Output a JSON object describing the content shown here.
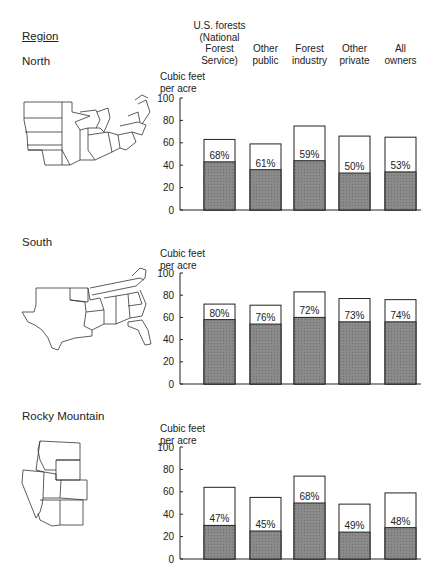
{
  "header": {
    "region_label": "Region",
    "columns": [
      "U.S. forests\n(National\nForest\nService)",
      "Other\npublic",
      "Forest\nindustry",
      "Other\nprivate",
      "All\nowners"
    ]
  },
  "colors": {
    "shaded": "#8a8a8a",
    "outline": "#222222",
    "background": "#ffffff"
  },
  "chart_data": [
    {
      "type": "bar",
      "title": "North",
      "ylabel": "Cubic feet per acre",
      "ylim": [
        0,
        100
      ],
      "yticks": [
        0,
        20,
        40,
        60,
        80,
        100
      ],
      "categories": [
        "U.S. forests (National Forest Service)",
        "Other public",
        "Forest industry",
        "Other private",
        "All owners"
      ],
      "series": [
        {
          "name": "total",
          "values": [
            63,
            59,
            75,
            66,
            65
          ]
        },
        {
          "name": "shaded_portion",
          "values": [
            43,
            36,
            44,
            33,
            34
          ]
        }
      ],
      "labels": [
        "68%",
        "61%",
        "59%",
        "50%",
        "53%"
      ]
    },
    {
      "type": "bar",
      "title": "South",
      "ylabel": "Cubic feet per acre",
      "ylim": [
        0,
        100
      ],
      "yticks": [
        0,
        20,
        40,
        60,
        80,
        100
      ],
      "categories": [
        "U.S. forests (National Forest Service)",
        "Other public",
        "Forest industry",
        "Other private",
        "All owners"
      ],
      "series": [
        {
          "name": "total",
          "values": [
            72,
            71,
            83,
            77,
            76
          ]
        },
        {
          "name": "shaded_portion",
          "values": [
            58,
            54,
            60,
            56,
            56
          ]
        }
      ],
      "labels": [
        "80%",
        "76%",
        "72%",
        "73%",
        "74%"
      ]
    },
    {
      "type": "bar",
      "title": "Rocky Mountain",
      "ylabel": "Cubic feet per acre",
      "ylim": [
        0,
        100
      ],
      "yticks": [
        0,
        20,
        40,
        60,
        80,
        100
      ],
      "categories": [
        "U.S. forests (National Forest Service)",
        "Other public",
        "Forest industry",
        "Other private",
        "All owners"
      ],
      "series": [
        {
          "name": "total",
          "values": [
            64,
            55,
            74,
            49,
            59
          ]
        },
        {
          "name": "shaded_portion",
          "values": [
            30,
            25,
            50,
            24,
            28
          ]
        }
      ],
      "labels": [
        "47%",
        "45%",
        "68%",
        "49%",
        "48%"
      ]
    }
  ]
}
